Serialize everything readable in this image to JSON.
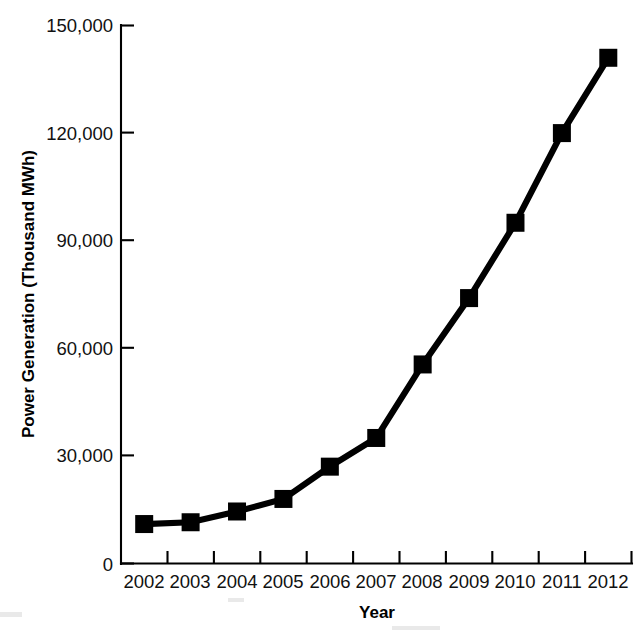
{
  "figure": {
    "background_color": "#ffffff",
    "ink_color": "#000000",
    "width": 635,
    "height": 633
  },
  "axes": {
    "y_title": "Power Generation (Thousand MWh)",
    "x_title": "Year",
    "y_ticks": [
      "0",
      "30,000",
      "60,000",
      "90,000",
      "120,000",
      "150,000"
    ],
    "x_ticks": [
      "2002",
      "2003",
      "2004",
      "2005",
      "2006",
      "2007",
      "2008",
      "2009",
      "2010",
      "2011",
      "2012"
    ]
  },
  "chart_data": {
    "type": "line",
    "title": "",
    "subtitle": "",
    "xlabel": "Year",
    "ylabel": "Power Generation (Thousand MWh)",
    "categories": [
      "2002",
      "2003",
      "2004",
      "2005",
      "2006",
      "2007",
      "2008",
      "2009",
      "2010",
      "2011",
      "2012"
    ],
    "x": [
      2002,
      2003,
      2004,
      2005,
      2006,
      2007,
      2008,
      2009,
      2010,
      2011,
      2012
    ],
    "values": [
      11000,
      11500,
      14500,
      18000,
      27000,
      35000,
      55500,
      74000,
      95000,
      120000,
      141000
    ],
    "series": [
      {
        "name": "Power Generation",
        "values": [
          11000,
          11500,
          14500,
          18000,
          27000,
          35000,
          55500,
          74000,
          95000,
          120000,
          141000
        ],
        "color": "#000000",
        "marker": "square",
        "line_width": 6
      }
    ],
    "ylim": [
      0,
      150000
    ],
    "ytick_values": [
      0,
      30000,
      60000,
      90000,
      120000,
      150000
    ],
    "ytick_labels": [
      "0",
      "30,000",
      "60,000",
      "90,000",
      "120,000",
      "150,000"
    ],
    "xtick_labels": [
      "2002",
      "2003",
      "2004",
      "2005",
      "2006",
      "2007",
      "2008",
      "2009",
      "2010",
      "2011",
      "2012"
    ],
    "grid": false,
    "legend": false,
    "legend_position": "none",
    "units": "Thousand MWh",
    "annotations": []
  }
}
